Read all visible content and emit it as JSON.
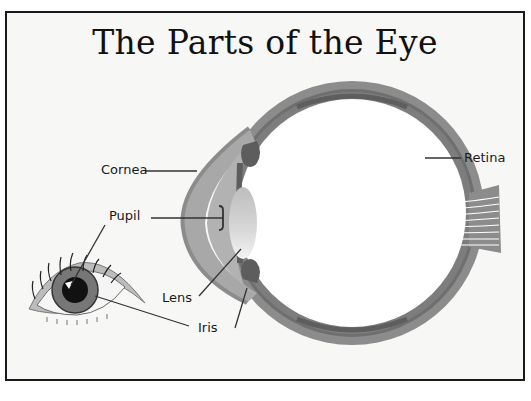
{
  "title": "The Parts of the Eye",
  "labels": {
    "cornea": "Cornea",
    "pupil": "Pupil",
    "lens": "Lens",
    "iris": "Iris",
    "retina": "Retina"
  },
  "colors": {
    "background": "#f7f7f6",
    "border": "#1a1a1a",
    "sclera_outer": "#8a8a8a",
    "sclera_inner": "#6e6e6e",
    "cornea": "#a9a9a9",
    "iris_tissue": "#5d5d5d",
    "lens": "#d2d2d2",
    "leader_line": "#333333"
  }
}
